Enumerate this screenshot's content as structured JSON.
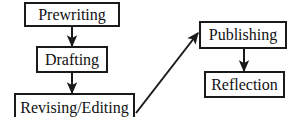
{
  "diagram": {
    "type": "flowchart",
    "orientation": "two-column, left column vertical chain feeding right column",
    "background_color": "#ffffff",
    "box_border_color": "#1a1a1a",
    "text_color": "#111111",
    "arrow_color": "#1a1a1a",
    "nodes": [
      {
        "id": "prewriting",
        "label": "Prewriting",
        "column": "left",
        "order": 1
      },
      {
        "id": "drafting",
        "label": "Drafting",
        "column": "left",
        "order": 2
      },
      {
        "id": "revising",
        "label": "Revising/Editing",
        "column": "left",
        "order": 3
      },
      {
        "id": "publishing",
        "label": "Publishing",
        "column": "right",
        "order": 4
      },
      {
        "id": "reflection",
        "label": "Reflection",
        "column": "right",
        "order": 5
      }
    ],
    "edges": [
      {
        "id": "edge-prewriting-drafting",
        "from": "Prewriting",
        "to": "Drafting",
        "style": "vertical-arrow-down"
      },
      {
        "id": "edge-drafting-revising",
        "from": "Drafting",
        "to": "Revising/Editing",
        "style": "vertical-arrow-down"
      },
      {
        "id": "edge-revising-publishing",
        "from": "Revising/Editing",
        "to": "Publishing",
        "style": "diagonal-arrow-up-right"
      },
      {
        "id": "edge-publishing-reflection",
        "from": "Publishing",
        "to": "Reflection",
        "style": "vertical-arrow-down"
      }
    ]
  }
}
